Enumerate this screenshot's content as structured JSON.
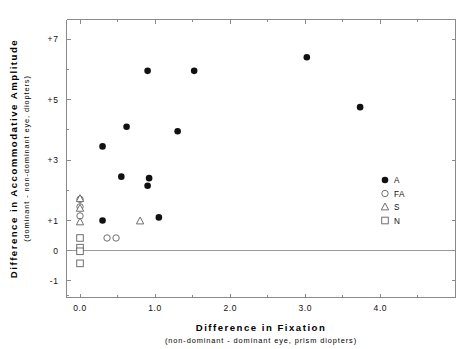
{
  "chart_data": {
    "type": "scatter",
    "title": "",
    "xlabel": "Difference in Fixation",
    "xlabel_sub": "(non-dominant  -  dominant eye, prism diopters)",
    "ylabel": "Difference in Accommodative Amplitude",
    "ylabel_sub": "(dominant  -  non-dominant eye, diopters)",
    "xlim": [
      -0.18,
      5.0
    ],
    "ylim": [
      -1.55,
      7.65
    ],
    "xticks": [
      0.0,
      1.0,
      2.0,
      3.0,
      4.0
    ],
    "xticklabels": [
      "0.0",
      "1.0",
      "2.0",
      "3.0",
      "4.0"
    ],
    "xminorticks": [
      0.5,
      1.5,
      2.5,
      3.5,
      4.5
    ],
    "yticks": [
      7,
      5,
      3,
      1,
      0,
      -1
    ],
    "yticklabels": [
      "+7",
      "+5",
      "+3",
      "+1",
      "0",
      "-1"
    ],
    "grid": false,
    "zero_line": 0,
    "legend_position": "right-middle",
    "series": [
      {
        "name": "A",
        "marker": "filled-circle",
        "points": [
          {
            "x": 0.3,
            "y": 3.45
          },
          {
            "x": 0.3,
            "y": 1.0
          },
          {
            "x": 0.55,
            "y": 2.45
          },
          {
            "x": 0.62,
            "y": 4.1
          },
          {
            "x": 0.9,
            "y": 2.15
          },
          {
            "x": 0.9,
            "y": 5.95
          },
          {
            "x": 0.92,
            "y": 2.4
          },
          {
            "x": 1.05,
            "y": 1.1
          },
          {
            "x": 1.3,
            "y": 3.95
          },
          {
            "x": 1.52,
            "y": 5.95
          },
          {
            "x": 3.02,
            "y": 6.4
          },
          {
            "x": 3.73,
            "y": 4.75
          }
        ]
      },
      {
        "name": "FA",
        "marker": "open-circle",
        "points": [
          {
            "x": 0.0,
            "y": 1.7
          },
          {
            "x": 0.0,
            "y": 1.45
          },
          {
            "x": 0.0,
            "y": 1.15
          },
          {
            "x": 0.0,
            "y": 0.02
          },
          {
            "x": 0.36,
            "y": 0.42
          },
          {
            "x": 0.48,
            "y": 0.42
          }
        ]
      },
      {
        "name": "S",
        "marker": "open-triangle",
        "points": [
          {
            "x": 0.0,
            "y": 1.72
          },
          {
            "x": 0.0,
            "y": 1.4
          },
          {
            "x": 0.0,
            "y": 0.95
          },
          {
            "x": 0.8,
            "y": 0.98
          }
        ]
      },
      {
        "name": "N",
        "marker": "open-square",
        "points": [
          {
            "x": 0.0,
            "y": 0.42
          },
          {
            "x": 0.0,
            "y": 0.1
          },
          {
            "x": 0.0,
            "y": -0.02
          },
          {
            "x": 0.0,
            "y": -0.42
          }
        ]
      }
    ],
    "legend": [
      {
        "label": "A",
        "marker": "filled-circle"
      },
      {
        "label": "FA",
        "marker": "open-circle"
      },
      {
        "label": "S",
        "marker": "open-triangle"
      },
      {
        "label": "N",
        "marker": "open-square"
      }
    ]
  }
}
